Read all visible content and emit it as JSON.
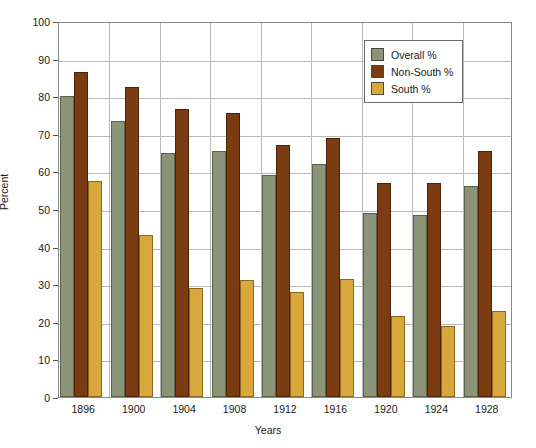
{
  "chart_data": {
    "type": "bar",
    "title": "",
    "xlabel": "Years",
    "ylabel": "Percent",
    "ylim": [
      0,
      100
    ],
    "ytick_step": 10,
    "yticks": [
      0,
      10,
      20,
      30,
      40,
      50,
      60,
      70,
      80,
      90,
      100
    ],
    "grid": true,
    "grid_axis": "both",
    "legend_position": "top-right",
    "categories": [
      "1896",
      "1900",
      "1904",
      "1908",
      "1912",
      "1916",
      "1920",
      "1924",
      "1928"
    ],
    "series": [
      {
        "name": "Overall %",
        "color": "#8b9379",
        "values": [
          80.0,
          73.5,
          65.0,
          65.5,
          59.0,
          62.0,
          49.0,
          48.5,
          56.0
        ]
      },
      {
        "name": "Non-South %",
        "color": "#7b3c12",
        "values": [
          86.5,
          82.5,
          76.5,
          75.5,
          67.0,
          69.0,
          57.0,
          57.0,
          65.5
        ]
      },
      {
        "name": "South %",
        "color": "#d8a83c",
        "values": [
          57.5,
          43.0,
          29.0,
          31.0,
          28.0,
          31.5,
          21.5,
          19.0,
          23.0
        ]
      }
    ]
  },
  "axis": {
    "ylabel": "Percent",
    "xlabel": "Years"
  }
}
